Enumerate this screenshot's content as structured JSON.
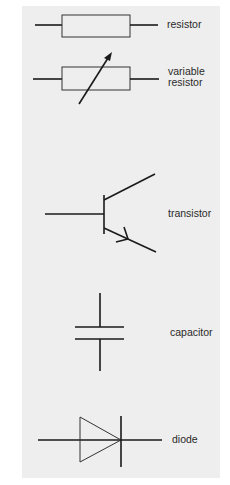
{
  "symbols": [
    {
      "id": "resistor",
      "label": "resistor"
    },
    {
      "id": "variable-resistor",
      "label": "variable\nresistor"
    },
    {
      "id": "transistor",
      "label": "transistor"
    },
    {
      "id": "capacitor",
      "label": "capacitor"
    },
    {
      "id": "diode",
      "label": "diode"
    }
  ],
  "colors": {
    "background": "#ffffff",
    "panel": "#eeeeee",
    "line": "#1a1a1a",
    "text": "#2a2a2a"
  }
}
